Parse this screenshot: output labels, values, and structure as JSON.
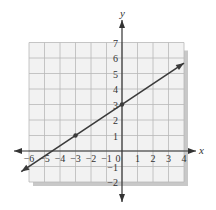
{
  "chart_data": {
    "type": "line",
    "title": "",
    "xlabel": "x",
    "ylabel": "y",
    "xlim": [
      -6,
      4
    ],
    "ylim": [
      -2,
      7
    ],
    "grid": true,
    "x_ticks": [
      -6,
      -5,
      -4,
      -3,
      -2,
      -1,
      0,
      1,
      2,
      3,
      4
    ],
    "y_ticks": [
      -2,
      -1,
      1,
      2,
      3,
      4,
      5,
      6,
      7
    ],
    "x_tick_labels": [
      "−6",
      "−5",
      "−4",
      "−3",
      "−2",
      "−1",
      "0",
      "1",
      "2",
      "3",
      "4"
    ],
    "y_tick_labels": [
      "−2",
      "−1",
      "1",
      "2",
      "3",
      "4",
      "5",
      "6",
      "7"
    ],
    "series": [
      {
        "name": "line",
        "equation": "y = (2/3)x + 3",
        "slope": 0.6667,
        "intercept": 3,
        "x": [
          -6.5,
          4
        ],
        "y": [
          -1.33,
          5.67
        ],
        "arrows": "both"
      }
    ],
    "points": [
      {
        "x": -3,
        "y": 1
      },
      {
        "x": 0,
        "y": 3
      }
    ],
    "colors": {
      "grid_bg": "#f2f2f2",
      "grid_line": "#b8b8b8",
      "shadow": "#c8c8c8",
      "axis": "#333333",
      "line": "#3a3a3a"
    }
  }
}
